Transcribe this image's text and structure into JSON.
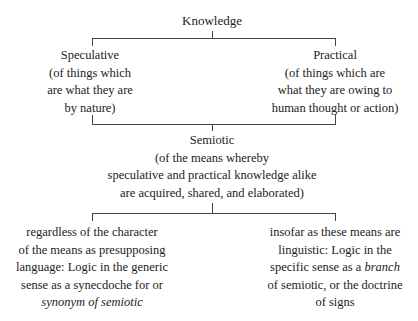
{
  "root": {
    "label": "Knowledge"
  },
  "level1": {
    "left": {
      "title": "Speculative",
      "lines": [
        "(of things which",
        "are what they are",
        "by nature)"
      ]
    },
    "right": {
      "title": "Practical",
      "lines": [
        "(of things which are",
        "what they are owing to",
        "human thought or action)"
      ]
    }
  },
  "level2": {
    "title": "Semiotic",
    "lines": [
      "(of the means whereby",
      "speculative and practical knowledge alike",
      "are acquired, shared, and elaborated)"
    ]
  },
  "level3": {
    "left": {
      "lines": [
        "regardless of the character",
        "of the means as presupposing",
        "language: Logic in the generic",
        "sense as a synecdoche for or"
      ],
      "italic_line": "synonym of semiotic"
    },
    "right": {
      "line1": "insofar as these means are",
      "line2": "linguistic: Logic in the",
      "line3_pre": "specific sense as a ",
      "line3_italic": "branch",
      "line4": "of semiotic, or the doctrine",
      "line5": "of signs"
    }
  }
}
